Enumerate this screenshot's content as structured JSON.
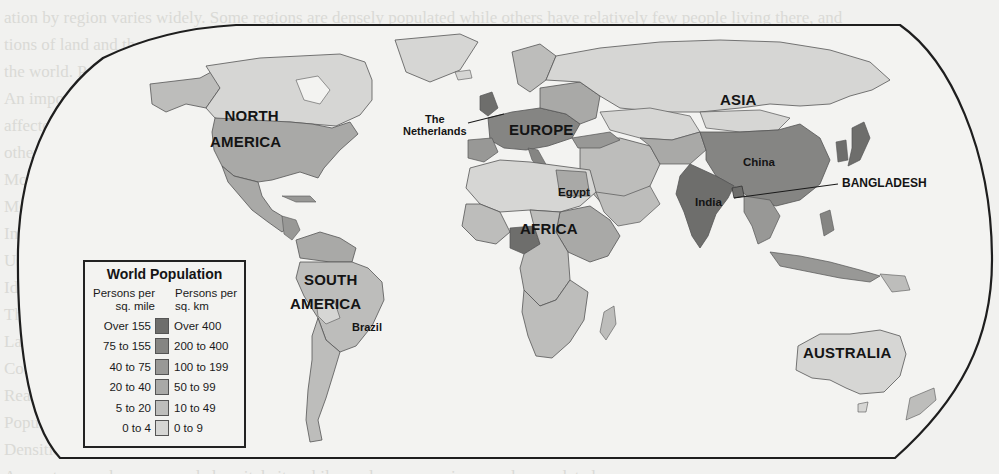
{
  "map": {
    "title": "World Population",
    "legend": {
      "title": "World Population",
      "left_header": "Persons per sq. mile",
      "left_header_lines": [
        "Persons per",
        "sq. mile"
      ],
      "right_header": "Persons per sq. km",
      "right_header_lines": [
        "Persons per",
        "sq. km"
      ],
      "classes": [
        {
          "sq_mile": "Over 155",
          "sq_km": "Over 400",
          "color": "#6e6e6c"
        },
        {
          "sq_mile": "75 to 155",
          "sq_km": "200 to 400",
          "color": "#858583"
        },
        {
          "sq_mile": "40 to 75",
          "sq_km": "100 to 199",
          "color": "#989896"
        },
        {
          "sq_mile": "20 to 40",
          "sq_km": "50 to 99",
          "color": "#a9a9a7"
        },
        {
          "sq_mile": "5 to 20",
          "sq_km": "10 to 49",
          "color": "#bdbdbb"
        },
        {
          "sq_mile": "0 to 4",
          "sq_km": "0 to 9",
          "color": "#d6d6d4"
        }
      ]
    },
    "labels": {
      "north_america": [
        "NORTH",
        "AMERICA"
      ],
      "south_america": [
        "SOUTH",
        "AMERICA"
      ],
      "europe": "EUROPE",
      "asia": "ASIA",
      "africa": "AFRICA",
      "australia": "AUSTRALIA",
      "netherlands": [
        "The",
        "Netherlands"
      ],
      "egypt": "Egypt",
      "china": "China",
      "india": "India",
      "bangladesh": "BANGLADESH",
      "brazil": "Brazil"
    },
    "colors": {
      "frame": "#1e1e1e",
      "ocean": "#f3f3f1",
      "page": "#f1f1ef"
    }
  },
  "background_text_lines": [
    "ation by region varies widely. Some regions are densely populated while others have relatively few people living there, and",
    "tions of land and the availability of resources influence where people choose to settle and how they make their living in",
    "the world. Population density is the average number of people per unit of area of land in a country or region of the",
    "An important factor is climate, physical features, natural resources, transportation, and economic opportunities, which have",
    "affected settlement patterns over time, and continue to shape the ways people live and work. Some places are crowded, while",
    "others remain nearly empty. Study the map to see how population is distributed across the continents of the world today.",
    "Most people live in lowland areas with good farmland and a mild climate, near rivers, coasts, and major trade routes.",
    "Mountains, deserts, and polar regions are sparsely settled. Compare the densities of different regions on the map.",
    "In which areas do the most people live? Which areas have the fewest people? What factors might explain these patterns?",
    "Use the legend to compare population density in persons per square mile and persons per square kilometer.",
    "Identify the continents and countries labeled on the map and describe their population densities.",
    "The most densely populated regions include parts of Asia and Europe, such as Bangladesh and the Netherlands.",
    "Large portions of Australia, northern Asia, and northern North America have very low population densities.",
    "Consider how physical geography and history have shaped these patterns of human settlement.",
    "Reading maps carefully helps geographers understand the relationship between people and places.",
    "Population data are gathered through censuses and surveys conducted by governments.",
    "Densities are averages and may hide great differences within a single country or region.",
    "A country may have a crowded capital city while rural areas remain sparsely populated."
  ]
}
